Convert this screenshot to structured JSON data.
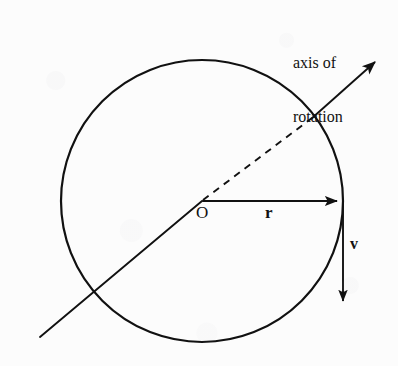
{
  "figure": {
    "name": "rotating-disk-tangential-velocity-diagram",
    "background_color": "#fcfcfc",
    "ink_color": "#111111"
  },
  "labels": {
    "axis_of_rotation_line1": "axis of",
    "axis_of_rotation_line2": "rotation",
    "origin": "O",
    "radius_vector": "r",
    "velocity_vector": "v"
  },
  "geometry": {
    "circle": {
      "cx": 202,
      "cy": 201,
      "r": 141,
      "stroke_width": 2.2
    },
    "axis_line": {
      "solid_lower_start": {
        "x": 40,
        "y": 337
      },
      "center": {
        "x": 202,
        "y": 201
      },
      "dashed_end_at_circle": {
        "x": 312,
        "y": 118
      },
      "arrow_tip": {
        "x": 379,
        "y": 59
      },
      "dash_pattern": "7 6",
      "stroke_width": 1.9
    },
    "radius_arrow": {
      "start": {
        "x": 203,
        "y": 201
      },
      "tip": {
        "x": 343,
        "y": 201
      },
      "stroke_width": 2.0
    },
    "velocity_arrow": {
      "start": {
        "x": 343,
        "y": 201
      },
      "tip": {
        "x": 343,
        "y": 307
      },
      "stroke_width": 1.9
    }
  }
}
